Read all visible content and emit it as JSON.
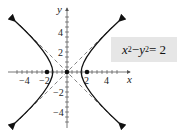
{
  "figure": {
    "equation": {
      "x": "x",
      "y": "y",
      "exp": "2",
      "minus": " − ",
      "equals": " = 2"
    },
    "axes": {
      "xlabel": "x",
      "ylabel": "y"
    },
    "xticks": [
      {
        "v": -4,
        "label": "−4"
      },
      {
        "v": -2,
        "label": "−2"
      },
      {
        "v": 2,
        "label": "2"
      },
      {
        "v": 4,
        "label": "4"
      }
    ],
    "yticks": [
      {
        "v": 4,
        "label": "4"
      },
      {
        "v": 2,
        "label": "2"
      },
      {
        "v": -2,
        "label": "−2"
      },
      {
        "v": -4,
        "label": "−4"
      }
    ],
    "points": [
      {
        "x": -2,
        "y": 0
      },
      {
        "x": 0,
        "y": 0
      },
      {
        "x": 2,
        "y": 0
      }
    ],
    "asymptotes": [
      "y = x",
      "y = −x"
    ],
    "curve": "x^2 - y^2 = 2",
    "colors": {
      "curve": "#111111",
      "box": "#e6e6e6"
    }
  }
}
